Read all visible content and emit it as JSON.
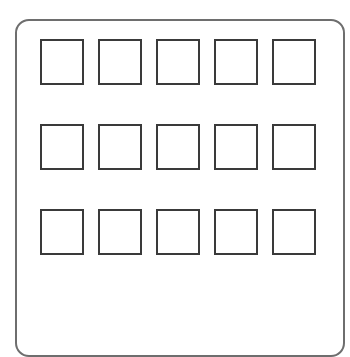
{
  "panel": {
    "border_color": "#6e6e6e",
    "background": "#ffffff"
  },
  "grid": {
    "rows": 3,
    "columns": 5,
    "slot_border_color": "#3a3a3a",
    "slots": [
      {
        "row": 1,
        "col": 1,
        "label": ""
      },
      {
        "row": 1,
        "col": 2,
        "label": ""
      },
      {
        "row": 1,
        "col": 3,
        "label": ""
      },
      {
        "row": 1,
        "col": 4,
        "label": ""
      },
      {
        "row": 1,
        "col": 5,
        "label": ""
      },
      {
        "row": 2,
        "col": 1,
        "label": ""
      },
      {
        "row": 2,
        "col": 2,
        "label": ""
      },
      {
        "row": 2,
        "col": 3,
        "label": ""
      },
      {
        "row": 2,
        "col": 4,
        "label": ""
      },
      {
        "row": 2,
        "col": 5,
        "label": ""
      },
      {
        "row": 3,
        "col": 1,
        "label": ""
      },
      {
        "row": 3,
        "col": 2,
        "label": ""
      },
      {
        "row": 3,
        "col": 3,
        "label": ""
      },
      {
        "row": 3,
        "col": 4,
        "label": ""
      },
      {
        "row": 3,
        "col": 5,
        "label": ""
      }
    ]
  }
}
